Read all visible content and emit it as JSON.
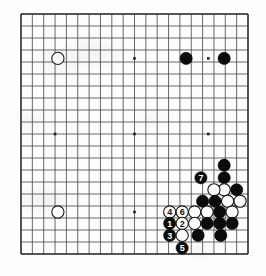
{
  "diagram": {
    "kind": "go-board-diagram",
    "board": {
      "grid_lines": 21,
      "origin_x": 21.0,
      "origin_y": 14.0,
      "cell_w": 11.35,
      "cell_h": 12.0,
      "stone_radius": 6.1,
      "line_color": "#3a3a3a",
      "edge_color": "#1e1e1e",
      "background": "#fdfdfc"
    },
    "star_points": [
      {
        "col": 3,
        "row": 3.7
      },
      {
        "col": 10,
        "row": 3.7
      },
      {
        "col": 16.5,
        "row": 3.7
      },
      {
        "col": 3,
        "row": 10
      },
      {
        "col": 10,
        "row": 10
      },
      {
        "col": 16.5,
        "row": 10
      },
      {
        "col": 3,
        "row": 16.5
      },
      {
        "col": 10,
        "row": 16.5
      },
      {
        "col": 16.5,
        "row": 16.5
      }
    ],
    "stones": [
      {
        "id": "w-upper-left",
        "color": "white",
        "col": 3.25,
        "row": 3.7,
        "label": ""
      },
      {
        "id": "b-top-a",
        "color": "black",
        "col": 14.55,
        "row": 3.7,
        "label": ""
      },
      {
        "id": "b-top-b",
        "color": "black",
        "col": 17.9,
        "row": 3.7,
        "label": ""
      },
      {
        "id": "w-lower-left",
        "color": "white",
        "col": 3.25,
        "row": 16.5,
        "label": ""
      },
      {
        "id": "b-r1",
        "color": "black",
        "col": 17.9,
        "row": 13.65,
        "label": ""
      },
      {
        "id": "b-mv7",
        "color": "black",
        "col": 15.85,
        "row": 13.65,
        "label": "7"
      },
      {
        "id": "w-r2",
        "color": "white",
        "col": 17.9,
        "row": 13.65,
        "label": "",
        "skip": true
      },
      {
        "id": "b-r0",
        "color": "black",
        "col": 17.9,
        "row": 12.6,
        "label": ""
      },
      {
        "id": "w-r3",
        "color": "white",
        "col": 17.9,
        "row": 14.65,
        "label": ""
      },
      {
        "id": "b-r4",
        "color": "black",
        "col": 19.0,
        "row": 14.65,
        "label": ""
      },
      {
        "id": "w-r5",
        "color": "white",
        "col": 17.0,
        "row": 14.65,
        "label": ""
      },
      {
        "id": "b-r6",
        "color": "black",
        "col": 16.0,
        "row": 15.6,
        "label": ""
      },
      {
        "id": "b-r7",
        "color": "black",
        "col": 17.1,
        "row": 15.6,
        "label": ""
      },
      {
        "id": "w-r8",
        "color": "white",
        "col": 18.2,
        "row": 15.6,
        "label": ""
      },
      {
        "id": "w-r9",
        "color": "white",
        "col": 19.3,
        "row": 15.6,
        "label": ""
      },
      {
        "id": "w-mv4",
        "color": "white",
        "col": 13.1,
        "row": 16.5,
        "label": "4"
      },
      {
        "id": "w-mv6",
        "color": "white",
        "col": 14.2,
        "row": 16.5,
        "label": "6"
      },
      {
        "id": "w-r10",
        "color": "white",
        "col": 15.3,
        "row": 16.5,
        "label": ""
      },
      {
        "id": "w-r11",
        "color": "white",
        "col": 16.4,
        "row": 16.5,
        "label": ""
      },
      {
        "id": "b-r12",
        "color": "black",
        "col": 17.5,
        "row": 16.5,
        "label": ""
      },
      {
        "id": "w-r13",
        "color": "white",
        "col": 18.6,
        "row": 16.5,
        "label": ""
      },
      {
        "id": "b-mv1",
        "color": "black",
        "col": 13.1,
        "row": 17.45,
        "label": "1"
      },
      {
        "id": "w-mv2",
        "color": "white",
        "col": 14.2,
        "row": 17.45,
        "label": "2"
      },
      {
        "id": "w-r14",
        "color": "white",
        "col": 15.3,
        "row": 17.45,
        "label": ""
      },
      {
        "id": "b-r15",
        "color": "black",
        "col": 16.4,
        "row": 17.45,
        "label": ""
      },
      {
        "id": "b-r16",
        "color": "black",
        "col": 17.5,
        "row": 17.45,
        "label": ""
      },
      {
        "id": "b-r17",
        "color": "black",
        "col": 18.6,
        "row": 17.45,
        "label": ""
      },
      {
        "id": "b-mv3",
        "color": "black",
        "col": 13.1,
        "row": 18.45,
        "label": "3"
      },
      {
        "id": "w-r18",
        "color": "white",
        "col": 14.2,
        "row": 18.45,
        "label": ""
      },
      {
        "id": "b-r19",
        "color": "black",
        "col": 15.6,
        "row": 18.45,
        "label": ""
      },
      {
        "id": "b-r20",
        "color": "black",
        "col": 17.6,
        "row": 18.45,
        "label": ""
      },
      {
        "id": "b-mv5",
        "color": "black",
        "col": 14.2,
        "row": 19.5,
        "label": "5"
      }
    ],
    "move_labels": [
      "1",
      "2",
      "3",
      "4",
      "5",
      "6",
      "7"
    ],
    "colors": {
      "black_stone": "#0b0b0b",
      "white_stone": "#fbfbfa",
      "label_on_black": "#ffffff",
      "label_on_white": "#101010"
    }
  }
}
